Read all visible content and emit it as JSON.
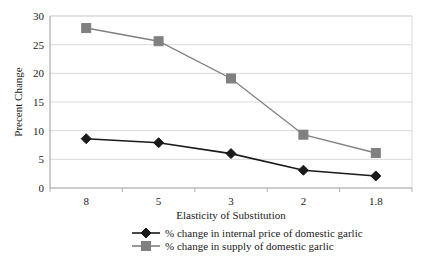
{
  "chart_data": {
    "type": "line",
    "title": "",
    "xlabel": "Elasticity of Substitution",
    "ylabel": "Precent Change",
    "categories": [
      "8",
      "5",
      "3",
      "2",
      "1.8"
    ],
    "ylim": [
      0,
      30
    ],
    "yticks": [
      "0",
      "5",
      "10",
      "15",
      "20",
      "25",
      "30"
    ],
    "ytick_values": [
      0,
      5,
      10,
      15,
      20,
      25,
      30
    ],
    "grid": true,
    "grid_axis": "y",
    "legend_position": "bottom",
    "series": [
      {
        "name": "% change in internal price of domestic garlic",
        "values": [
          8.6,
          7.9,
          6.0,
          3.1,
          2.1
        ],
        "color": "#1a1a1a",
        "marker": "diamond"
      },
      {
        "name": "% change in supply of domestic garlic",
        "values": [
          27.9,
          25.6,
          19.1,
          9.3,
          6.1
        ],
        "color": "#808080",
        "marker": "square"
      }
    ]
  },
  "axes": {
    "y_title": "Precent Change",
    "x_title": "Elasticity of Substitution"
  },
  "legend": {
    "entries": [
      {
        "label": "% change in internal price of domestic garlic",
        "marker": "diamond-marker",
        "color": "#1a1a1a"
      },
      {
        "label": "% change in supply of domestic garlic",
        "marker": "square-marker",
        "color": "#808080"
      }
    ]
  },
  "ticks": {
    "y": [
      "0",
      "5",
      "10",
      "15",
      "20",
      "25",
      "30"
    ],
    "x": [
      "8",
      "5",
      "3",
      "2",
      "1.8"
    ]
  },
  "colors": {
    "series_price": "#1a1a1a",
    "series_supply": "#808080",
    "grid": "#d9d9d9",
    "axis": "#b0b0b0",
    "background": "#ffffff",
    "text": "#1a1a1a"
  }
}
